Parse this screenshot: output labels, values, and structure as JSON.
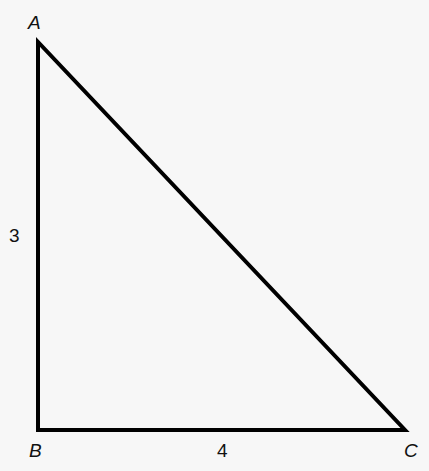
{
  "diagram": {
    "type": "right-triangle",
    "vertices": {
      "A": {
        "label": "A",
        "x": 38,
        "y": 42
      },
      "B": {
        "label": "B",
        "x": 38,
        "y": 430
      },
      "C": {
        "label": "C",
        "x": 405,
        "y": 430
      }
    },
    "sides": {
      "AB": {
        "label": "3"
      },
      "BC": {
        "label": "4"
      }
    },
    "stroke_color": "#000000",
    "background": "#f7f7f7"
  }
}
